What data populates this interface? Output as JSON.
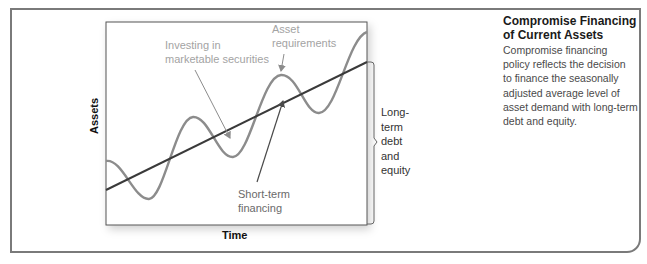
{
  "figure": {
    "axis": {
      "y_label": "Assets",
      "x_label": "Time"
    },
    "annotations": {
      "investing": [
        "Investing in",
        "marketable securities"
      ],
      "asset_requirements": [
        "Asset",
        "requirements"
      ],
      "short_term": [
        "Short-term",
        "financing"
      ],
      "long_term": [
        "Long-",
        "term",
        "debt",
        "and",
        "equity"
      ]
    },
    "colors": {
      "asset_curve": "#8c8c8c",
      "financing_line": "#3a3a3a",
      "annotation_text": "#a3a3a3",
      "frame": "#7a7a7a"
    }
  },
  "sidebar": {
    "title": "Compromise Financing of Current Assets",
    "title_lines": [
      "Compromise Financing",
      "of Current Assets"
    ],
    "body": "Compromise financing policy reflects the decision to finance the seasonally adjusted average level of asset demand with long-term debt and equity.",
    "body_lines": [
      "Compromise financing",
      "policy reflects the decision",
      "to finance the seasonally",
      "adjusted average level of",
      "asset demand with long-term",
      "debt and equity."
    ]
  }
}
